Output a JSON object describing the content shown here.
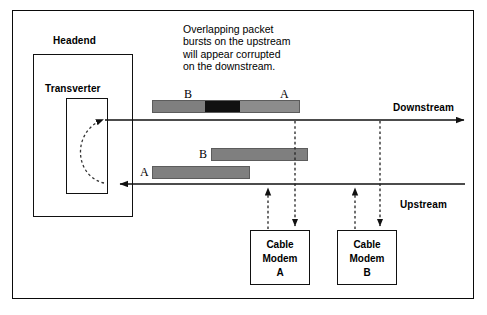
{
  "diagram": {
    "annotation": "Overlapping packet\nbursts on the upstream\nwill appear corrupted\non the downstream.",
    "headend_label": "Headend",
    "transverter_label": "Transverter",
    "downstream_label": "Downstream",
    "upstream_label": "Upstream",
    "downstream_bar": {
      "label_left": "B",
      "label_right": "A",
      "segments": [
        {
          "name": "burst-b-clean",
          "color": "#7f7f7f"
        },
        {
          "name": "collision-corrupted",
          "color": "#111111"
        },
        {
          "name": "burst-a-clean",
          "color": "#8c8c8c"
        }
      ]
    },
    "upstream_burst_b": {
      "label": "B",
      "color": "#7f7f7f"
    },
    "upstream_burst_a": {
      "label": "A",
      "color": "#7f7f7f"
    },
    "modems": [
      {
        "line1": "Cable",
        "line2": "Modem",
        "line3": "A"
      },
      {
        "line1": "Cable",
        "line2": "Modem",
        "line3": "B"
      }
    ],
    "colors": {
      "stroke": "#111111",
      "packet_gray": "#7f7f7f",
      "packet_black": "#111111",
      "background": "#ffffff"
    }
  }
}
